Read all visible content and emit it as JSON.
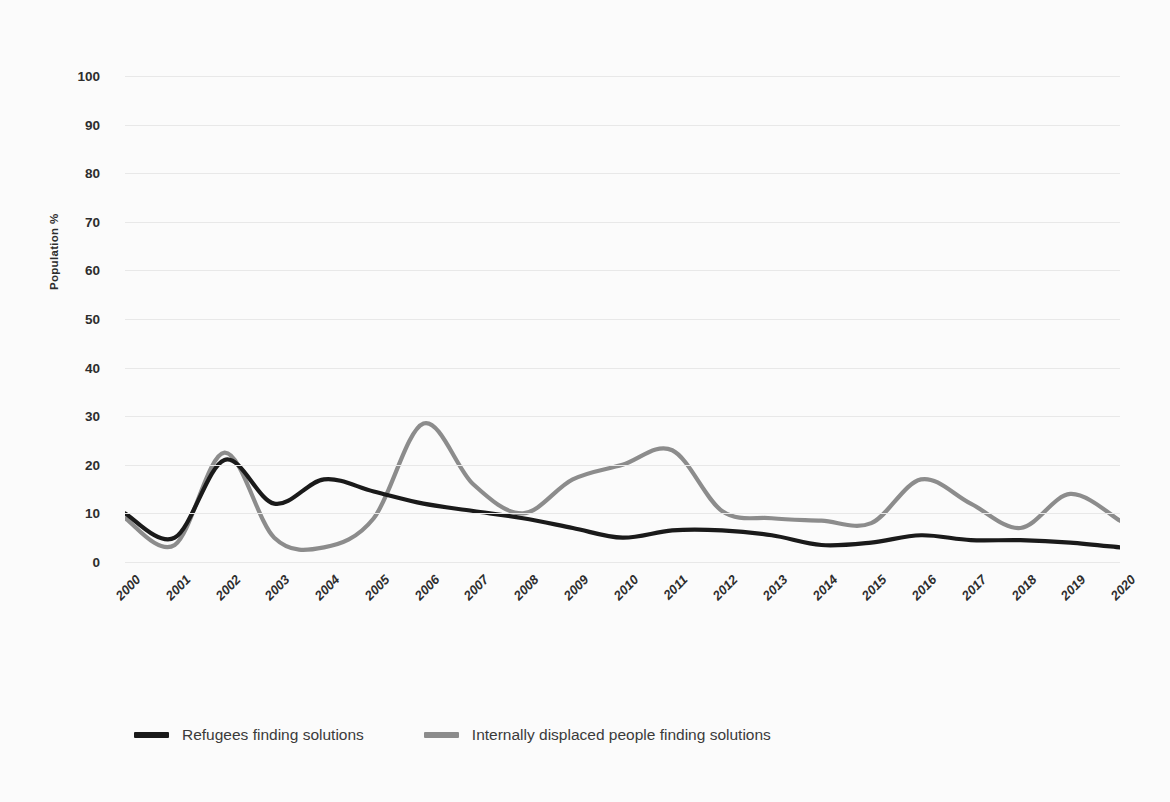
{
  "chart_data": {
    "type": "line",
    "title": "",
    "xlabel": "",
    "ylabel": "Population %",
    "ylim": [
      0,
      100
    ],
    "yticks": [
      0,
      10,
      20,
      30,
      40,
      50,
      60,
      70,
      80,
      90,
      100
    ],
    "grid": true,
    "legend_position": "bottom-left",
    "x": [
      "2000",
      "2001",
      "2002",
      "2003",
      "2004",
      "2005",
      "2006",
      "2007",
      "2008",
      "2009",
      "2010",
      "2011",
      "2012",
      "2013",
      "2014",
      "2015",
      "2016",
      "2017",
      "2018",
      "2019",
      "2020"
    ],
    "series": [
      {
        "name": "Refugees finding solutions",
        "color": "#1a1a1a",
        "values": [
          10,
          5,
          21,
          12,
          17,
          14.5,
          12,
          10.5,
          9,
          7,
          5,
          6.5,
          6.5,
          5.5,
          3.5,
          4,
          5.5,
          4.5,
          4.5,
          4,
          3
        ]
      },
      {
        "name": "Internally displaced people finding solutions",
        "color": "#8c8c8c",
        "values": [
          9,
          3.5,
          22.5,
          5,
          3,
          9,
          28.5,
          16,
          10,
          17,
          20,
          23,
          10.5,
          9,
          8.5,
          8,
          17,
          12,
          7,
          14,
          8.5
        ]
      }
    ]
  },
  "axes": {
    "y_title": "Population %",
    "y_tick_labels": [
      "100",
      "90",
      "80",
      "70",
      "60",
      "50",
      "40",
      "30",
      "20",
      "10",
      "0"
    ],
    "x_tick_labels": [
      "2000",
      "2001",
      "2002",
      "2003",
      "2004",
      "2005",
      "2006",
      "2007",
      "2008",
      "2009",
      "2010",
      "2011",
      "2012",
      "2013",
      "2014",
      "2015",
      "2016",
      "2017",
      "2018",
      "2019",
      "2020"
    ]
  },
  "legend": {
    "items": [
      {
        "label": "Refugees finding solutions",
        "color": "#1a1a1a"
      },
      {
        "label": "Internally displaced people finding solutions",
        "color": "#8c8c8c"
      }
    ]
  },
  "colors": {
    "background": "#fbfbfb",
    "gridline": "#e8e8e8",
    "series_refugees": "#1a1a1a",
    "series_idp": "#8c8c8c",
    "text": "#2d2d2d"
  }
}
